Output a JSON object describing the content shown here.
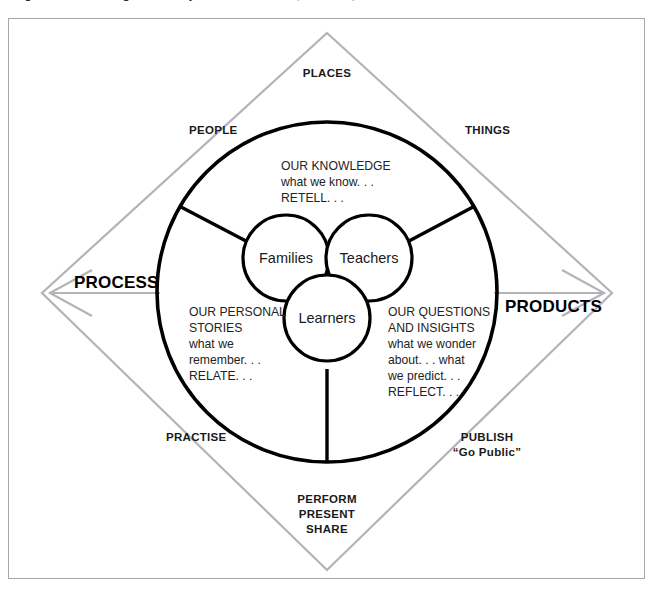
{
  "caption": {
    "text": "Figure : The learning community model — learners, teachers, families"
  },
  "diagram": {
    "axis_labels": {
      "left": "PROCESS",
      "right": "PRODUCTS"
    },
    "diamond_labels": {
      "top": "PLACES",
      "upper_left": "PEOPLE",
      "upper_right": "THINGS",
      "lower_left": "PRACTISE",
      "lower_right_line1": "PUBLISH",
      "lower_right_line2": "“Go Public”",
      "bottom_line1": "PERFORM",
      "bottom_line2": "PRESENT",
      "bottom_line3": "SHARE"
    },
    "nodes": [
      {
        "id": "families",
        "label": "Families"
      },
      {
        "id": "teachers",
        "label": "Teachers"
      },
      {
        "id": "learners",
        "label": "Learners"
      }
    ],
    "sectors": [
      {
        "id": "knowledge",
        "lines": [
          "OUR KNOWLEDGE",
          "what we know. . .",
          "RETELL. . ."
        ]
      },
      {
        "id": "personal-stories",
        "lines": [
          "OUR PERSONAL",
          "STORIES",
          "what we",
          "remember. . .",
          "RELATE. . ."
        ]
      },
      {
        "id": "questions-insights",
        "lines": [
          "OUR QUESTIONS",
          "AND INSIGHTS",
          "what we wonder",
          "about. . .  what",
          "we predict. . .",
          "REFLECT. . ."
        ]
      }
    ],
    "colors": {
      "diamond_stroke": "#b4b4b8",
      "ring_stroke": "#000000",
      "frame_border": "#a7a7ab",
      "text": "#1a1a1a",
      "background": "#ffffff"
    }
  }
}
